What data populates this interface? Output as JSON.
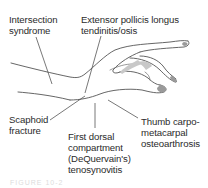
{
  "figure": {
    "colors": {
      "line": "#555555",
      "text": "#2b2b2b",
      "nail": "#9a9a9a",
      "nail_light": "#c8c8c8"
    },
    "labels": [
      {
        "id": "intersection",
        "text": "Intersection\nsyndrome"
      },
      {
        "id": "epl",
        "text": "Extensor pollicis longus\ntendinitis/osis"
      },
      {
        "id": "scaphoid",
        "text": "Scaphoid\nfracture"
      },
      {
        "id": "dequervain",
        "text": "First dorsal\ncompartment\n(DeQuervain's)\ntenosynovitis"
      },
      {
        "id": "cmc",
        "text": "Thumb carpo-\nmetacarpal\nosteoarthrosis"
      }
    ],
    "caption": "FIGURE 10-2"
  }
}
